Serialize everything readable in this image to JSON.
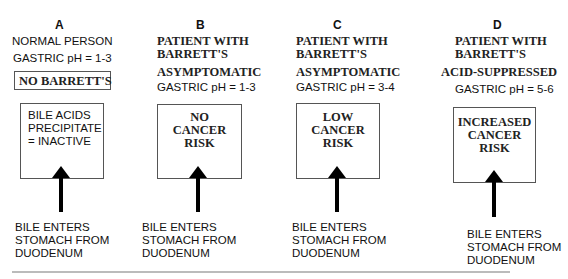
{
  "panels": [
    {
      "id": "A",
      "letter": "A",
      "header_lines": [
        "NORMAL PERSON"
      ],
      "gastric_ph": "GASTRIC pH = 1-3",
      "label_box": "NO BARRETT'S",
      "outcome_lines": [
        "BILE ACIDS",
        "PRECIPITATE",
        "= INACTIVE"
      ],
      "bottom_lines": [
        "BILE ENTERS",
        "STOMACH FROM",
        "DUODENUM"
      ]
    },
    {
      "id": "B",
      "letter": "B",
      "header_lines": [
        "PATIENT WITH",
        "BARRETT'S",
        "ASYMPTOMATIC"
      ],
      "gastric_ph": "GASTRIC pH = 1-3",
      "outcome_lines": [
        "NO",
        "CANCER",
        "RISK"
      ],
      "bottom_lines": [
        "BILE ENTERS",
        "STOMACH FROM",
        "DUODENUM"
      ]
    },
    {
      "id": "C",
      "letter": "C",
      "header_lines": [
        "PATIENT WITH",
        "BARRETT'S",
        "ASYMPTOMATIC"
      ],
      "gastric_ph": "GASTRIC pH = 3-4",
      "outcome_lines": [
        "LOW",
        "CANCER",
        "RISK"
      ],
      "bottom_lines": [
        "BILE ENTERS",
        "STOMACH FROM",
        "DUODENUM"
      ]
    },
    {
      "id": "D",
      "letter": "D",
      "header_lines": [
        "PATIENT WITH",
        "BARRETT'S",
        "ACID-SUPPRESSED"
      ],
      "gastric_ph": "GASTRIC pH = 5-6",
      "outcome_lines": [
        "INCREASED",
        "CANCER",
        "RISK"
      ],
      "bottom_lines": [
        "BILE ENTERS",
        "STOMACH FROM",
        "DUODENUM"
      ]
    }
  ],
  "colors": {
    "text": "#111111",
    "box_border": "#555555",
    "arrow": "#000000",
    "rule": "#bbbbbb"
  }
}
